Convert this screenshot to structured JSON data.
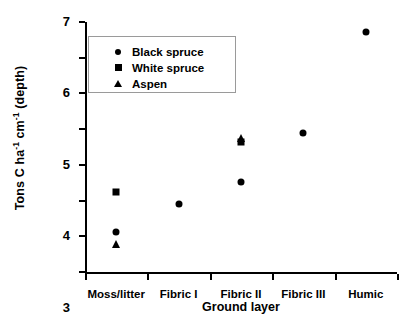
{
  "chart_data": {
    "type": "scatter",
    "title": "",
    "xlabel": "Ground layer",
    "ylabel": "Tons C ha-1 cm-1 (depth)",
    "ylabel_parts": {
      "pre": "Tons C ha",
      "sup1": "-1",
      "mid": " cm",
      "sup2": "-1",
      "post": " (depth)"
    },
    "categories": [
      "Moss/litter",
      "Fibric I",
      "Fibric II",
      "Fibric III",
      "Humic"
    ],
    "ylim": [
      0,
      7
    ],
    "yticks": [
      0,
      1,
      2,
      3,
      4,
      5,
      6,
      7
    ],
    "ytick_labels": [
      "0",
      "1",
      "2",
      "3",
      "4",
      "5",
      "6",
      "7"
    ],
    "grid": false,
    "legend_position": "upper left",
    "series": [
      {
        "name": "Black spruce",
        "marker": "circle",
        "color": "#000000",
        "points": [
          {
            "x": "Moss/litter",
            "y": 1.12
          },
          {
            "x": "Fibric I",
            "y": 1.9
          },
          {
            "x": "Fibric II",
            "y": 2.51
          },
          {
            "x": "Fibric III",
            "y": 3.89
          },
          {
            "x": "Humic",
            "y": 6.72
          }
        ]
      },
      {
        "name": "White spruce",
        "marker": "square",
        "color": "#000000",
        "points": [
          {
            "x": "Moss/litter",
            "y": 2.25
          },
          {
            "x": "Fibric II",
            "y": 3.63
          }
        ]
      },
      {
        "name": "Aspen",
        "marker": "triangle",
        "color": "#000000",
        "points": [
          {
            "x": "Moss/litter",
            "y": 0.79
          },
          {
            "x": "Fibric II",
            "y": 3.75
          }
        ]
      }
    ]
  },
  "legend": {
    "items": [
      {
        "label": "Black spruce",
        "marker": "circle"
      },
      {
        "label": "White spruce",
        "marker": "square"
      },
      {
        "label": "Aspen",
        "marker": "triangle"
      }
    ]
  }
}
